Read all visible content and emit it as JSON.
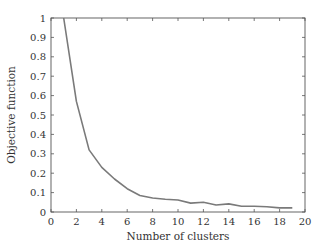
{
  "chart_data": {
    "type": "line",
    "title": "",
    "xlabel": "Number of clusters",
    "ylabel": "Objective function",
    "xlim": [
      0,
      20
    ],
    "ylim": [
      0,
      1
    ],
    "xticks": [
      0,
      2,
      4,
      6,
      8,
      10,
      12,
      14,
      16,
      18,
      20
    ],
    "yticks": [
      0,
      0.1,
      0.2,
      0.3,
      0.4,
      0.5,
      0.6,
      0.7,
      0.8,
      0.9,
      1
    ],
    "xtick_labels": [
      "0",
      "2",
      "4",
      "6",
      "8",
      "10",
      "12",
      "14",
      "16",
      "18",
      "20"
    ],
    "ytick_labels": [
      "0",
      "0.1",
      "0.2",
      "0.3",
      "0.4",
      "0.5",
      "0.6",
      "0.7",
      "0.8",
      "0.9",
      "1"
    ],
    "grid": false,
    "legend": null,
    "series": [
      {
        "name": "Objective function",
        "color": "#7a7a7a",
        "x": [
          1,
          2,
          3,
          4,
          5,
          6,
          7,
          8,
          9,
          10,
          11,
          12,
          13,
          14,
          15,
          16,
          17,
          18,
          19
        ],
        "values": [
          1.0,
          0.57,
          0.32,
          0.23,
          0.17,
          0.12,
          0.085,
          0.072,
          0.066,
          0.062,
          0.046,
          0.05,
          0.036,
          0.042,
          0.03,
          0.03,
          0.027,
          0.021,
          0.021
        ]
      }
    ]
  }
}
